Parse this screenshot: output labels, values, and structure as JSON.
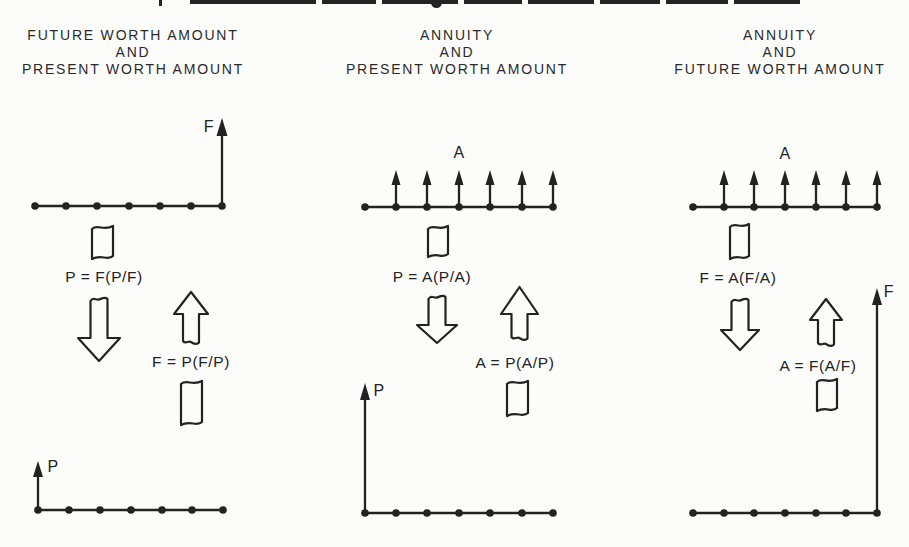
{
  "colors": {
    "ink": "#222222",
    "background": "#fcfcfb"
  },
  "columns": [
    {
      "header": [
        "FUTURE WORTH AMOUNT",
        "AND",
        "PRESENT WORTH AMOUNT"
      ],
      "top_diagram": {
        "tick_count": 7,
        "flow_label": "F",
        "flow": "single arrow up at final period"
      },
      "down_formula": "P = F(P/F)",
      "up_formula": "F = P(F/P)",
      "bottom_diagram": {
        "tick_count": 7,
        "flow_label": "P",
        "flow": "single arrow up at time zero"
      }
    },
    {
      "header": [
        "ANNUITY",
        "AND",
        "PRESENT WORTH AMOUNT"
      ],
      "top_diagram": {
        "tick_count": 7,
        "flow_label": "A",
        "flow": "uniform arrows up at periods 1-6",
        "arrow_count": 6
      },
      "down_formula": "P = A(P/A)",
      "up_formula": "A = P(A/P)",
      "bottom_diagram": {
        "tick_count": 7,
        "flow_label": "P",
        "flow": "single arrow up at time zero"
      }
    },
    {
      "header": [
        "ANNUITY",
        "AND",
        "FUTURE WORTH AMOUNT"
      ],
      "top_diagram": {
        "tick_count": 7,
        "flow_label": "A",
        "flow": "uniform arrows up at periods 1-6",
        "arrow_count": 6
      },
      "down_formula": "F = A(F/A)",
      "up_formula": "A = F(A/F)",
      "bottom_diagram": {
        "tick_count": 7,
        "flow_label": "F",
        "flow": "single arrow up at final period"
      }
    }
  ]
}
